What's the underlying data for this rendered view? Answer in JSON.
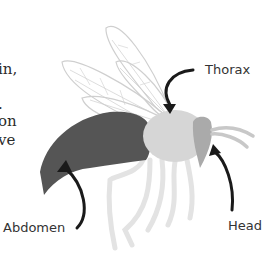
{
  "text_fragments": [
    {
      "text": "in,",
      "x": -2,
      "y": 64
    },
    {
      "text": ".",
      "x": -2,
      "y": 100
    },
    {
      "text": "on",
      "x": -2,
      "y": 118
    },
    {
      "text": "ve",
      "x": -2,
      "y": 137
    }
  ],
  "labels": {
    "thorax": "Thorax",
    "abdomen": "Abdomen",
    "head": "Head"
  },
  "colors": {
    "abdomen": "#555555",
    "thorax": "#d6d6d6",
    "head": "#aaaaaa",
    "legs": "#e3e3e3",
    "wings": "#cfcfcf",
    "arrow": "#1a1a1a"
  }
}
